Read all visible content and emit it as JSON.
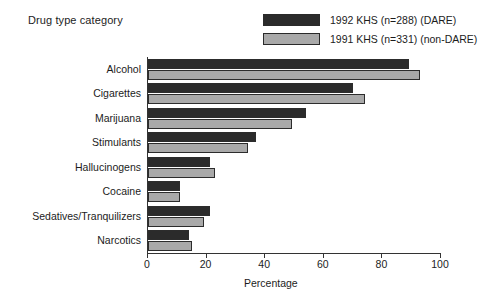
{
  "chart_data": {
    "type": "bar",
    "orientation": "horizontal",
    "title": "Drug type category",
    "xlabel": "Percentage",
    "ylabel": "",
    "xlim": [
      0,
      100
    ],
    "xticks": [
      0,
      20,
      40,
      60,
      80,
      100
    ],
    "grid": false,
    "legend_position": "top-right",
    "categories": [
      "Alcohol",
      "Cigarettes",
      "Marijuana",
      "Stimulants",
      "Hallucinogens",
      "Cocaine",
      "Sedatives/Tranquilizers",
      "Narcotics"
    ],
    "series": [
      {
        "name": "1992 KHS (n=288) (DARE)",
        "color": "#2b2b2b",
        "values": [
          89,
          70,
          54,
          37,
          21,
          11,
          21,
          14
        ]
      },
      {
        "name": "1991 KHS (n=331) (non-DARE)",
        "color": "#a9a9a9",
        "values": [
          93,
          74,
          49,
          34,
          23,
          11,
          19,
          15
        ]
      }
    ]
  },
  "legend": {
    "items": [
      {
        "label": "1992 KHS (n=288) (DARE)",
        "swatch": "dark"
      },
      {
        "label": "1991 KHS (n=331) (non-DARE)",
        "swatch": "light"
      }
    ]
  }
}
